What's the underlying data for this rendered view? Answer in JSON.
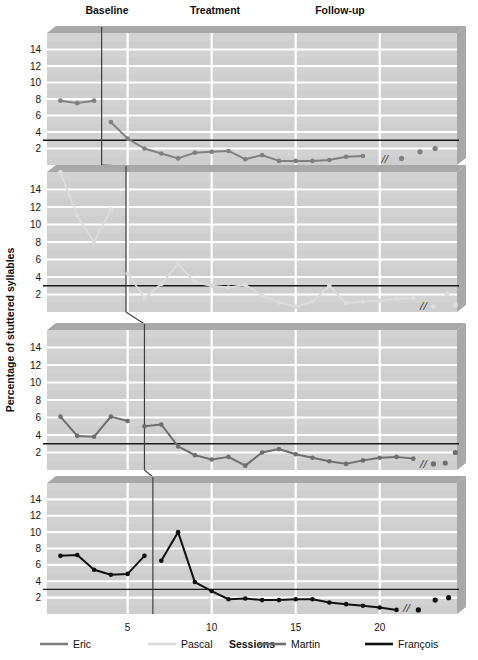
{
  "header": {
    "phase_labels": [
      {
        "text": "Baseline",
        "x": 107
      },
      {
        "text": "Treatment",
        "x": 215
      },
      {
        "text": "Follow-up",
        "x": 340
      }
    ]
  },
  "axes": {
    "y_title": "Percentage of stuttered syllables",
    "x_title": "Sessions",
    "y_ticks": [
      2,
      4,
      6,
      8,
      10,
      12,
      14
    ],
    "y_tick_labels": [
      "2",
      "4",
      "6",
      "8",
      "10",
      "12",
      "14"
    ],
    "x_ticks": [
      5,
      10,
      15,
      20
    ],
    "x_tick_labels": [
      "5",
      "10",
      "15",
      "20"
    ],
    "ylim": [
      0,
      16
    ],
    "xlim": [
      0.2,
      24.6
    ],
    "criterion_line_value": 3,
    "break_marker": "//"
  },
  "legend": [
    {
      "label": "Eric",
      "color": "#808080",
      "x": 40
    },
    {
      "label": "Pascal",
      "color": "#dcdcdc",
      "x": 148
    },
    {
      "label": "Martin",
      "color": "#6e6e6e",
      "x": 258
    },
    {
      "label": "François",
      "color": "#101010",
      "x": 365
    }
  ],
  "colors": {
    "panel_background": "#d2d2d2",
    "panel_band": "#cacaca",
    "panel_top_shadow": "#a8a8a8",
    "panel_right_shadow": "#a8a8a8",
    "gridline": "#ffffff",
    "criterion_line": "#1a1a1a",
    "phase_line": "#404040",
    "text": "#111111"
  },
  "chart_data": {
    "type": "line",
    "title": "",
    "xlabel": "Sessions",
    "ylabel": "Percentage of stuttered syllables",
    "xlim": [
      0.2,
      24.6
    ],
    "ylim": [
      0,
      16
    ],
    "grid": true,
    "legend_position": "bottom",
    "design": "multiple-baseline across participants",
    "phases": [
      "Baseline",
      "Treatment",
      "Follow-up"
    ],
    "criterion_line": 3,
    "panels": [
      {
        "name": "Eric",
        "color": "#808080",
        "phase_line_x": 3.45,
        "baseline": {
          "x": [
            1,
            2,
            3
          ],
          "y": [
            7.8,
            7.5,
            7.8
          ]
        },
        "treatment": {
          "x": [
            4,
            5,
            6,
            7,
            8,
            9,
            10,
            11,
            12,
            13,
            14,
            15,
            16,
            17,
            18,
            19
          ],
          "y": [
            5.2,
            3.2,
            2.0,
            1.4,
            0.8,
            1.5,
            1.6,
            1.7,
            0.7,
            1.2,
            0.5,
            0.5,
            0.5,
            0.6,
            1.0,
            1.1
          ]
        },
        "followup": {
          "x": [
            21.3,
            22.4,
            23.3
          ],
          "y": [
            0.8,
            1.6,
            2.0
          ]
        },
        "break_x": 20.3
      },
      {
        "name": "Pascal",
        "color": "#dcdcdc",
        "phase_line_x": 4.9,
        "baseline": {
          "x": [
            1,
            2,
            3,
            4
          ],
          "y": [
            16.0,
            11.0,
            8.0,
            11.7
          ]
        },
        "treatment": {
          "x": [
            5,
            6,
            7,
            8,
            9,
            10,
            11,
            12,
            13,
            14,
            15,
            16,
            17,
            18,
            19,
            20,
            21,
            22
          ],
          "y": [
            4.4,
            1.6,
            3.2,
            5.5,
            3.4,
            3.0,
            2.8,
            3.1,
            1.9,
            1.1,
            0.6,
            1.2,
            3.0,
            1.0,
            1.2,
            1.3,
            1.5,
            1.6,
            1.7
          ]
        },
        "followup": {
          "x": [
            23.2,
            24.0,
            24.5
          ],
          "y": [
            0.6,
            2.1,
            0.8
          ]
        },
        "break_x": 22.6
      },
      {
        "name": "Martin",
        "color": "#6e6e6e",
        "phase_line_x": 6.0,
        "baseline": {
          "x": [
            1,
            2,
            3,
            4,
            5
          ],
          "y": [
            6.1,
            3.9,
            3.8,
            6.1,
            5.6
          ]
        },
        "treatment": {
          "x": [
            6,
            7,
            8,
            9,
            10,
            11,
            12,
            13,
            14,
            15,
            16,
            17,
            18,
            19,
            20,
            21,
            22
          ],
          "y": [
            5.0,
            5.2,
            2.7,
            1.7,
            1.2,
            1.5,
            0.5,
            2.0,
            2.4,
            1.8,
            1.4,
            1.0,
            0.7,
            1.1,
            1.4,
            1.5,
            1.3
          ]
        },
        "followup": {
          "x": [
            23.2,
            23.9,
            24.5
          ],
          "y": [
            0.7,
            0.8,
            2.0
          ]
        },
        "break_x": 22.6
      },
      {
        "name": "François",
        "color": "#101010",
        "phase_line_x": 6.5,
        "baseline": {
          "x": [
            1,
            2,
            3,
            4,
            5,
            6
          ],
          "y": [
            7.1,
            7.2,
            5.4,
            4.8,
            4.9,
            7.1
          ]
        },
        "treatment": {
          "x": [
            7,
            8,
            9,
            10,
            11,
            12,
            13,
            14,
            15,
            16,
            17,
            18,
            19,
            20,
            21
          ],
          "y": [
            6.5,
            10.0,
            3.9,
            2.8,
            1.8,
            1.9,
            1.7,
            1.7,
            1.8,
            1.8,
            1.4,
            1.2,
            1.0,
            0.8,
            0.5
          ]
        },
        "followup": {
          "x": [
            22.3,
            23.3,
            24.1
          ],
          "y": [
            0.5,
            1.7,
            2.0
          ]
        },
        "break_x": 21.6
      }
    ]
  }
}
